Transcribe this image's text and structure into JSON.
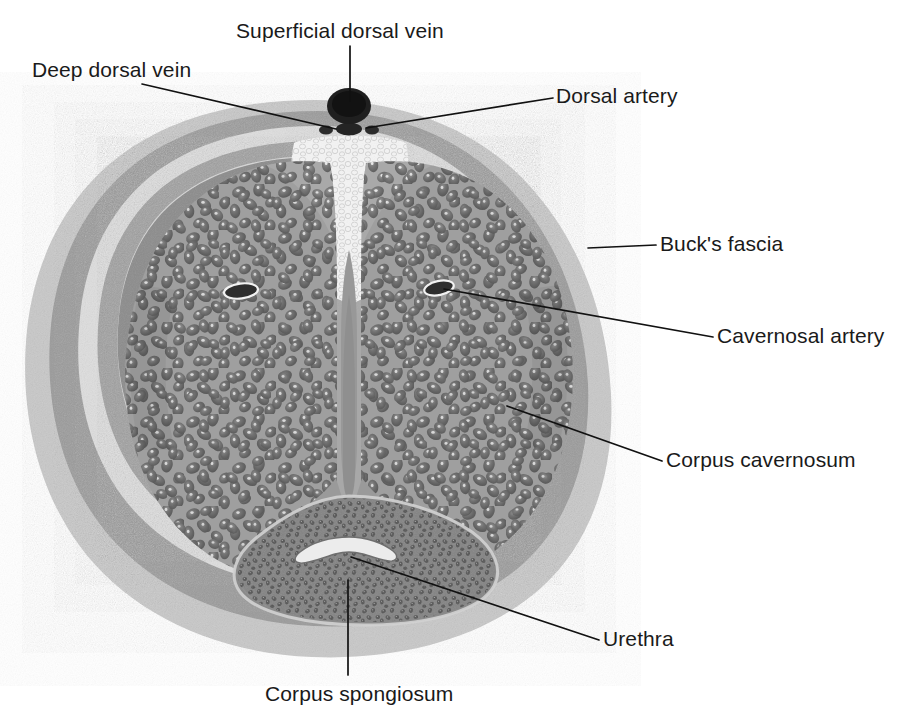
{
  "figure": {
    "type": "anatomical-cross-section",
    "background_color": "#ffffff"
  },
  "palette": {
    "skin_outer": "#c9c9c9",
    "dartos_ring": "#9a9a9a",
    "areolar_gap": "#dcdcdc",
    "bucks_fascia_ring": "#9e9e9e",
    "tunica_albuginea": "#8d8d8d",
    "cavernous_tissue": "#a8a8a8",
    "trabecula_dark": "#6a6a6a",
    "spongiosum_body": "#8a8a8a",
    "spongiosum_speckle": "#5e5e5e",
    "septum": "#949494",
    "vessel_dark": "#2b2b2b",
    "urethra_lumen": "#e8e8e8",
    "neurovascular_pale": "#f2f2f2",
    "label_color": "#1a1a1a",
    "leader_color": "#111111"
  },
  "labels": [
    {
      "id": "superficial-dorsal-vein",
      "text": "Superficial dorsal vein",
      "text_x": 236,
      "text_y": 38,
      "anchor": "start",
      "leader": "M350,46 L350,101"
    },
    {
      "id": "deep-dorsal-vein",
      "text": "Deep dorsal vein",
      "text_x": 32,
      "text_y": 77,
      "anchor": "start",
      "leader": "M142,84 L336,129"
    },
    {
      "id": "dorsal-artery",
      "text": "Dorsal artery",
      "text_x": 556,
      "text_y": 103,
      "anchor": "start",
      "leader": "M553,98 L366,128"
    },
    {
      "id": "bucks-fascia",
      "text": "Buck's fascia",
      "text_x": 660,
      "text_y": 251,
      "anchor": "start",
      "leader": "M656,245 L588,248"
    },
    {
      "id": "cavernosal-artery",
      "text": "Cavernosal artery",
      "text_x": 717,
      "text_y": 343,
      "anchor": "start",
      "leader": "M713,337 L444,289"
    },
    {
      "id": "corpus-cavernosum",
      "text": "Corpus cavernosum",
      "text_x": 666,
      "text_y": 467,
      "anchor": "start",
      "leader": "M662,461 L507,406"
    },
    {
      "id": "urethra",
      "text": "Urethra",
      "text_x": 603,
      "text_y": 646,
      "anchor": "start",
      "leader": "M599,640 L351,557"
    },
    {
      "id": "corpus-spongiosum",
      "text": "Corpus spongiosum",
      "text_x": 265,
      "text_y": 701,
      "anchor": "start",
      "leader": "M348,580 L348,675"
    }
  ],
  "structures": [
    {
      "id": "skin",
      "name": "skin-outer-layer"
    },
    {
      "id": "dartos",
      "name": "dartos-ring"
    },
    {
      "id": "bucks",
      "name": "bucks-fascia-ring"
    },
    {
      "id": "tunica",
      "name": "tunica-albuginea"
    },
    {
      "id": "corpus-cavernosum-left",
      "name": "corpus-cavernosum-left"
    },
    {
      "id": "corpus-cavernosum-right",
      "name": "corpus-cavernosum-right"
    },
    {
      "id": "septum",
      "name": "intercavernous-septum"
    },
    {
      "id": "corpus-spongiosum",
      "name": "corpus-spongiosum-body"
    },
    {
      "id": "urethra-lumen",
      "name": "urethra-lumen"
    },
    {
      "id": "superficial-dorsal-vein",
      "name": "superficial-dorsal-vein-vessel"
    },
    {
      "id": "deep-dorsal-vein",
      "name": "deep-dorsal-vein-vessel"
    },
    {
      "id": "dorsal-artery-left",
      "name": "dorsal-artery-left-vessel"
    },
    {
      "id": "dorsal-artery-right",
      "name": "dorsal-artery-right-vessel"
    },
    {
      "id": "cavernosal-artery-left",
      "name": "cavernosal-artery-left-vessel"
    },
    {
      "id": "cavernosal-artery-right",
      "name": "cavernosal-artery-right-vessel"
    }
  ]
}
